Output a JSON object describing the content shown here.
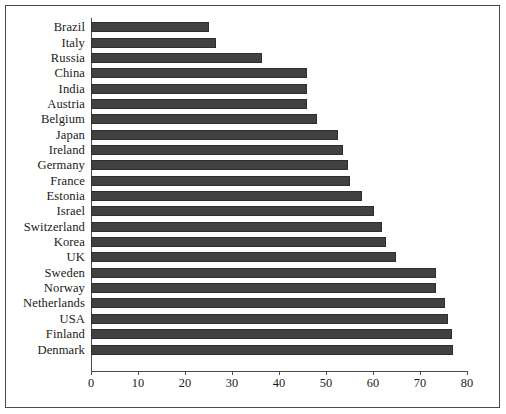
{
  "chart_data": {
    "type": "bar",
    "orientation": "horizontal",
    "title": "",
    "subtitle": "",
    "xlabel": "",
    "ylabel": "",
    "xlim": [
      0,
      80
    ],
    "xticks": [
      0,
      10,
      20,
      30,
      40,
      50,
      60,
      70,
      80
    ],
    "xtick_labels": [
      "0",
      "10",
      "20",
      "30",
      "40",
      "50",
      "60",
      "70",
      "80"
    ],
    "grid": false,
    "legend": null,
    "bar_color": "#414141",
    "border_color": "#4a4a4a",
    "background_color": "#ffffff",
    "categories": [
      "Brazil",
      "Italy",
      "Russia",
      "China",
      "India",
      "Austria",
      "Belgium",
      "Japan",
      "Ireland",
      "Germany",
      "France",
      "Estonia",
      "Israel",
      "Switzerland",
      "Korea",
      "UK",
      "Sweden",
      "Norway",
      "Netherlands",
      "USA",
      "Finland",
      "Denmark"
    ],
    "values": [
      25.0,
      26.6,
      36.3,
      46.0,
      46.0,
      46.0,
      48.0,
      52.5,
      53.7,
      54.6,
      55.2,
      57.6,
      60.3,
      62.0,
      62.7,
      64.8,
      73.5,
      73.5,
      75.3,
      76.0,
      76.8,
      77.0
    ]
  },
  "chart": {
    "axis_name": "x-axis",
    "category_axis_name": "y-axis"
  }
}
